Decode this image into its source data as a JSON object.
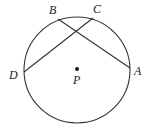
{
  "diagram": {
    "type": "circle-with-intersecting-chords",
    "colors": {
      "stroke": "#333333",
      "text": "#222222",
      "background": "#ffffff"
    },
    "circle": {
      "cx": 77,
      "cy": 70,
      "r": 53
    },
    "center": {
      "label": "P",
      "x": 77,
      "y": 69
    },
    "points": [
      {
        "label": "A",
        "x": 130,
        "y": 68
      },
      {
        "label": "B",
        "x": 58,
        "y": 19
      },
      {
        "label": "C",
        "x": 93,
        "y": 18
      },
      {
        "label": "D",
        "x": 24,
        "y": 72
      }
    ],
    "chords": [
      {
        "from": "B",
        "to": "A"
      },
      {
        "from": "C",
        "to": "D"
      }
    ],
    "labels": {
      "A": "A",
      "B": "B",
      "C": "C",
      "D": "D",
      "P": "P"
    }
  }
}
